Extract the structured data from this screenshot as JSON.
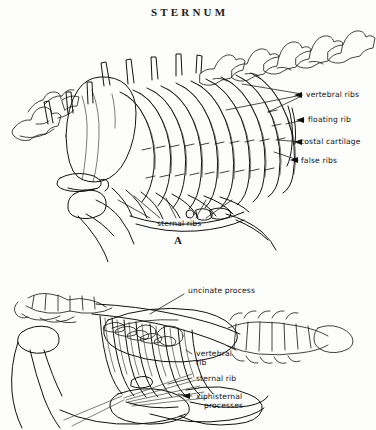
{
  "plate": {
    "title": "STERNUM",
    "subject": "avian-skeleton-sternum-and-ribs",
    "background_color": "#fdfdfb",
    "ink_color": "#111111"
  },
  "figures": [
    {
      "id": "A",
      "letter": "A",
      "view": "lateral view of thorax, ribs and sternum",
      "labels": [
        {
          "key": "vertebral_ribs",
          "text": "vertebral ribs",
          "x": 306,
          "y": 95
        },
        {
          "key": "floating_rib",
          "text": "floating rib",
          "x": 308,
          "y": 120
        },
        {
          "key": "costal_cartilage",
          "text": "costal cartilage",
          "x": 306,
          "y": 142
        },
        {
          "key": "false_ribs",
          "text": "false ribs",
          "x": 301,
          "y": 161
        },
        {
          "key": "sternal_ribs",
          "text": "sternal ribs",
          "x": 157,
          "y": 223
        }
      ]
    },
    {
      "id": "B",
      "letter": "",
      "view": "lateral view of trunk skeleton with uncinate processes",
      "labels": [
        {
          "key": "uncinate_process",
          "text": "uncinate process",
          "x": 186,
          "y": 290
        },
        {
          "key": "vertebral_rib",
          "text": "vertebral",
          "x": 196,
          "y": 353
        },
        {
          "key": "vertebral_rib_line2",
          "text": "rib",
          "x": 196,
          "y": 362
        },
        {
          "key": "sternal_rib",
          "text": "sternal rib",
          "x": 196,
          "y": 378
        },
        {
          "key": "xiphisternal",
          "text": "xiphisternal",
          "x": 196,
          "y": 396
        },
        {
          "key": "xiphisternal_line2",
          "text": "processes",
          "x": 204,
          "y": 405
        }
      ]
    }
  ]
}
